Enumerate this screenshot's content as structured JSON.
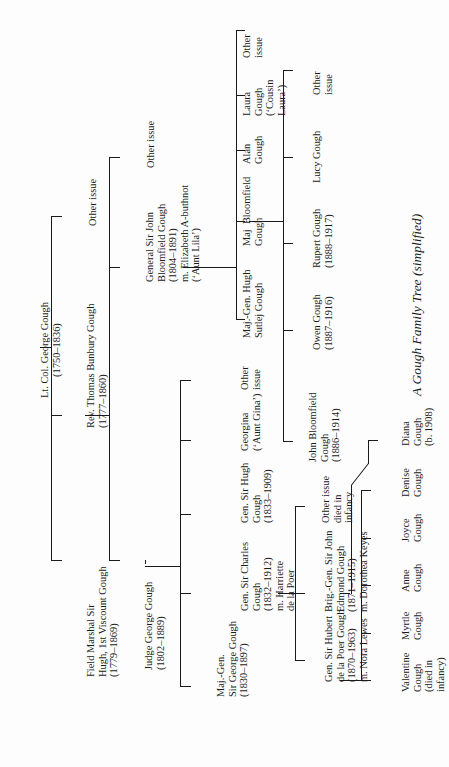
{
  "page": {
    "caption": "A Gough Family Tree (simplified)",
    "orientation": "rotated 90° counter-clockwise"
  },
  "tree": {
    "root": {
      "lines": [
        "Lt. Col. George Gough",
        "(1750–1836)"
      ]
    },
    "gen2": {
      "hugh": {
        "lines": [
          "Field Marshal Sir",
          "Hugh, 1st Viscount Gough",
          "(1779–1869)"
        ]
      },
      "thomas": {
        "lines": [
          "Rev. Thomas Bunbury Gough",
          "(1777–1860)"
        ]
      },
      "other": {
        "lines": [
          "Other issue"
        ]
      }
    },
    "gen3": {
      "judge": {
        "lines": [
          "Judge George Gough",
          "(1802–1889)"
        ]
      },
      "john_b": {
        "lines": [
          "General Sir John",
          "Bloomfield Gough",
          "(1804–1891)",
          "m. Elizabeth A-buthnot",
          "(‘Aunt Lila’)"
        ]
      },
      "other": {
        "lines": [
          "Other issue"
        ]
      }
    },
    "gen4_judge": {
      "george": {
        "lines": [
          "Maj.-Gen.",
          "Sir George Gough",
          "(1830–1897)"
        ]
      },
      "charles": {
        "lines": [
          "Gen. Sir Charles",
          "Gough",
          "(1832–1912)",
          "m. Harriette",
          "de la Poer"
        ]
      },
      "hugh": {
        "lines": [
          "Gen. Sir Hugh",
          "Gough",
          "(1833–1909)"
        ]
      },
      "georgina": {
        "lines": [
          "Georgina",
          "(‘Aunt Gina’)"
        ]
      },
      "other": {
        "lines": [
          "Other",
          "issue"
        ]
      }
    },
    "gen4_john": {
      "hugh_s": {
        "lines": [
          "Maj.-Gen. Hugh",
          "Sutlej Gough"
        ]
      },
      "bloomfield": {
        "lines": [
          "Maj  Bloomfield",
          "Gough"
        ]
      },
      "alan": {
        "lines": [
          "Alan",
          "Gough"
        ]
      },
      "laura": {
        "lines": [
          "Laura",
          "Gough",
          "(‘Cousin",
          "Laura’)"
        ]
      },
      "other": {
        "lines": [
          "Other",
          "issue"
        ]
      }
    },
    "gen5_charles": {
      "hubert": {
        "lines": [
          "Gen. Sir Hubert",
          "de la Poer Gough",
          "(1870–1963)",
          "m. Nora Lewes"
        ]
      },
      "johnedmond": {
        "lines": [
          "Brig.-Gen. Sir John",
          "Edmond Gough",
          "(1871–1915)",
          "m. Dorothea Keyes"
        ]
      },
      "other": {
        "lines": [
          "Other issue",
          "died in",
          "infancy"
        ]
      }
    },
    "gen5_bloomfield": {
      "john": {
        "lines": [
          "John Bloomfield",
          "Gough",
          "(1886–1914)"
        ]
      },
      "owen": {
        "lines": [
          "Owen Gough",
          "(1887–1916)"
        ]
      },
      "rupert": {
        "lines": [
          "Rupert Gough",
          "(1888–1917)"
        ]
      },
      "lucy": {
        "lines": [
          "Lucy Gough"
        ]
      },
      "other": {
        "lines": [
          "Other",
          "issue"
        ]
      }
    },
    "gen6_hubert": {
      "valentine": {
        "lines": [
          "Valentine",
          "Gough",
          "(died in",
          "infancy)"
        ]
      },
      "myrtle": {
        "lines": [
          "Myrtle",
          "Gough"
        ]
      },
      "anne": {
        "lines": [
          "Anne",
          "Gough"
        ]
      },
      "joyce": {
        "lines": [
          "Joyce",
          "Gough"
        ]
      },
      "denise": {
        "lines": [
          "Denise",
          "Gough"
        ]
      }
    },
    "gen6_johnedmond": {
      "diana": {
        "lines": [
          "Diana",
          "Gough",
          "(b. 1908)"
        ]
      }
    }
  }
}
